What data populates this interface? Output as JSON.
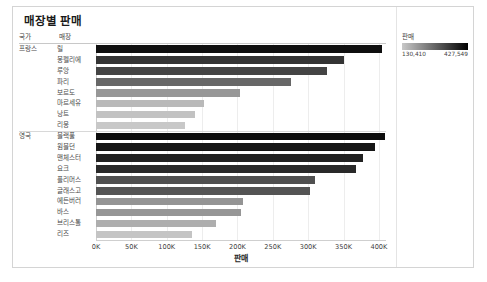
{
  "title": "매장별 판매",
  "table_headers": {
    "country": "국가",
    "store": "매장"
  },
  "legend": {
    "title": "판매",
    "min_label": "130,410",
    "max_label": "427,549",
    "min_value": 130410,
    "max_value": 427549,
    "color_min": "#c8c8c8",
    "color_max": "#000000"
  },
  "axis": {
    "title": "판매",
    "ticks": [
      "0K",
      "50K",
      "100K",
      "150K",
      "200K",
      "250K",
      "300K",
      "350K",
      "400K"
    ],
    "tick_values": [
      0,
      50000,
      100000,
      150000,
      200000,
      250000,
      300000,
      350000,
      400000
    ],
    "min": 0,
    "max": 410000
  },
  "chart_data": {
    "type": "bar",
    "orientation": "horizontal",
    "title": "매장별 판매",
    "xlabel": "판매",
    "ylabel": "",
    "xlim": [
      0,
      410000
    ],
    "grid": true,
    "legend_position": "top-right",
    "color_encoding": "value",
    "groups": [
      {
        "name": "프랑스",
        "categories": [
          "릴",
          "몽펠리에",
          "루앙",
          "파리",
          "보르도",
          "마르세유",
          "낭트",
          "리옹"
        ],
        "values": [
          405000,
          351000,
          326000,
          275000,
          203000,
          153000,
          140000,
          126000
        ]
      },
      {
        "name": "영국",
        "categories": [
          "블랙풀",
          "윔블던",
          "맨체스터",
          "요크",
          "플리머스",
          "글래스고",
          "에든버러",
          "바스",
          "브리스톨",
          "리즈"
        ],
        "values": [
          408000,
          395000,
          377000,
          367000,
          309000,
          303000,
          208000,
          205000,
          169000,
          136000
        ]
      }
    ]
  }
}
